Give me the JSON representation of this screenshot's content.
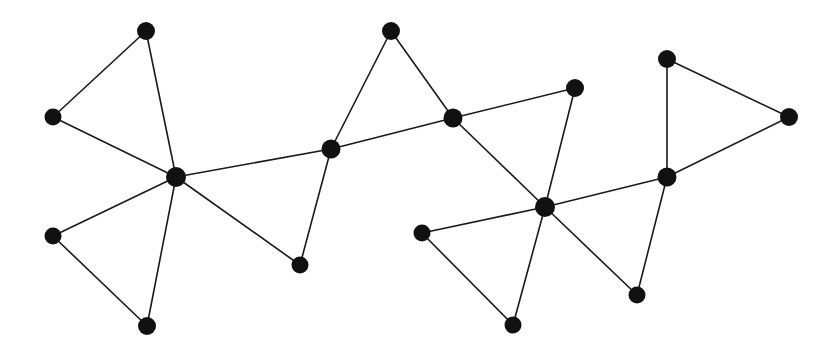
{
  "figure": {
    "type": "node-link-graph",
    "background_color": "#ffffff",
    "width": 836,
    "height": 346,
    "title": "",
    "caption": ""
  },
  "style": {
    "node_color": "#111111",
    "edge_color": "#1a1a1a",
    "edge_width": 1.6,
    "node_radius_default": 8.5,
    "node_radius_hub": 10
  },
  "chart_data": {
    "type": "graph",
    "title": "",
    "xlabel": "",
    "ylabel": "",
    "grid": false,
    "legend": null,
    "node_count": 17,
    "edge_count": 21,
    "nodes": [
      {
        "id": "n1",
        "label": "",
        "x": 146,
        "y": 31,
        "r": 9,
        "degree": 2
      },
      {
        "id": "n2",
        "label": "",
        "x": 53,
        "y": 117,
        "r": 8.5,
        "degree": 2
      },
      {
        "id": "n3",
        "label": "",
        "x": 176,
        "y": 177,
        "r": 10,
        "degree": 6
      },
      {
        "id": "n4",
        "label": "",
        "x": 53,
        "y": 236,
        "r": 8.5,
        "degree": 2
      },
      {
        "id": "n5",
        "label": "",
        "x": 147,
        "y": 326,
        "r": 9,
        "degree": 2
      },
      {
        "id": "n6",
        "label": "",
        "x": 300,
        "y": 265,
        "r": 8.5,
        "degree": 2
      },
      {
        "id": "n7",
        "label": "",
        "x": 331,
        "y": 149,
        "r": 9.5,
        "degree": 4
      },
      {
        "id": "n8",
        "label": "",
        "x": 391,
        "y": 31,
        "r": 9,
        "degree": 2
      },
      {
        "id": "n9",
        "label": "",
        "x": 453,
        "y": 118,
        "r": 9.5,
        "degree": 4
      },
      {
        "id": "n10",
        "label": "",
        "x": 575,
        "y": 88,
        "r": 9,
        "degree": 2
      },
      {
        "id": "n11",
        "label": "",
        "x": 422,
        "y": 233,
        "r": 8.5,
        "degree": 2
      },
      {
        "id": "n12",
        "label": "",
        "x": 545,
        "y": 207,
        "r": 10,
        "degree": 6
      },
      {
        "id": "n13",
        "label": "",
        "x": 513,
        "y": 325,
        "r": 8.5,
        "degree": 2
      },
      {
        "id": "n14",
        "label": "",
        "x": 637,
        "y": 295,
        "r": 8.5,
        "degree": 2
      },
      {
        "id": "n15",
        "label": "",
        "x": 667,
        "y": 177,
        "r": 9.5,
        "degree": 4
      },
      {
        "id": "n16",
        "label": "",
        "x": 667,
        "y": 59,
        "r": 9,
        "degree": 2
      },
      {
        "id": "n17",
        "label": "",
        "x": 789,
        "y": 117,
        "r": 9,
        "degree": 2
      }
    ],
    "edges": [
      {
        "source": "n1",
        "target": "n2"
      },
      {
        "source": "n1",
        "target": "n3"
      },
      {
        "source": "n2",
        "target": "n3"
      },
      {
        "source": "n3",
        "target": "n4"
      },
      {
        "source": "n3",
        "target": "n5"
      },
      {
        "source": "n3",
        "target": "n6"
      },
      {
        "source": "n3",
        "target": "n7"
      },
      {
        "source": "n4",
        "target": "n5"
      },
      {
        "source": "n6",
        "target": "n7"
      },
      {
        "source": "n7",
        "target": "n8"
      },
      {
        "source": "n7",
        "target": "n9"
      },
      {
        "source": "n8",
        "target": "n9"
      },
      {
        "source": "n9",
        "target": "n10"
      },
      {
        "source": "n9",
        "target": "n12"
      },
      {
        "source": "n10",
        "target": "n12"
      },
      {
        "source": "n11",
        "target": "n12"
      },
      {
        "source": "n11",
        "target": "n13"
      },
      {
        "source": "n12",
        "target": "n13"
      },
      {
        "source": "n12",
        "target": "n14"
      },
      {
        "source": "n12",
        "target": "n15"
      },
      {
        "source": "n14",
        "target": "n15"
      },
      {
        "source": "n15",
        "target": "n16"
      },
      {
        "source": "n15",
        "target": "n17"
      },
      {
        "source": "n16",
        "target": "n17"
      }
    ]
  }
}
